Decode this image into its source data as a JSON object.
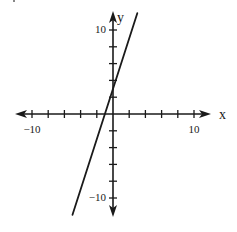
{
  "chart_data": {
    "type": "line",
    "title": "",
    "xlabel": "x",
    "ylabel": "y",
    "xlim": [
      -12,
      12
    ],
    "ylim": [
      -12,
      12
    ],
    "grid": false,
    "x_tick_step": 2,
    "y_tick_step": 2,
    "x_tick_labels": [
      {
        "value": -10,
        "label": "−10"
      },
      {
        "value": 10,
        "label": "10"
      }
    ],
    "y_tick_labels": [
      {
        "value": 10,
        "label": "10"
      },
      {
        "value": -10,
        "label": "−10"
      }
    ],
    "series": [
      {
        "name": "line",
        "equation": "y = 3x + 3",
        "slope": 3,
        "intercept": 3,
        "x": [
          -5,
          3
        ],
        "y": [
          -12,
          12
        ],
        "color": "#1a1a1a"
      }
    ],
    "axes_color": "#1a1a1a"
  }
}
